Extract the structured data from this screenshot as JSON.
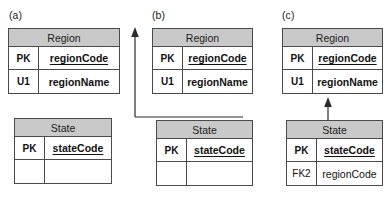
{
  "figure": {
    "panels": [
      {
        "label": "(a)",
        "tables": [
          {
            "name": "Region",
            "rows": [
              {
                "key": "PK",
                "attribute": "regionCode",
                "style": "pk"
              },
              {
                "key": "U1",
                "attribute": "regionName",
                "style": "bold"
              }
            ]
          },
          {
            "name": "State",
            "rows": [
              {
                "key": "PK",
                "attribute": "stateCode",
                "style": "pk"
              },
              {
                "key": "",
                "attribute": "",
                "style": "empty"
              }
            ]
          }
        ],
        "connector": "none"
      },
      {
        "label": "(b)",
        "tables": [
          {
            "name": "Region",
            "rows": [
              {
                "key": "PK",
                "attribute": "regionCode",
                "style": "pk"
              },
              {
                "key": "U1",
                "attribute": "regionName",
                "style": "bold"
              }
            ]
          },
          {
            "name": "State",
            "rows": [
              {
                "key": "PK",
                "attribute": "stateCode",
                "style": "pk"
              },
              {
                "key": "",
                "attribute": "",
                "style": "empty"
              }
            ]
          }
        ],
        "connector": "elbow-arrow-up-to-region"
      },
      {
        "label": "(c)",
        "tables": [
          {
            "name": "Region",
            "rows": [
              {
                "key": "PK",
                "attribute": "regionCode",
                "style": "pk"
              },
              {
                "key": "U1",
                "attribute": "regionName",
                "style": "bold"
              }
            ]
          },
          {
            "name": "State",
            "rows": [
              {
                "key": "PK",
                "attribute": "stateCode",
                "style": "pk"
              },
              {
                "key": "FK2",
                "attribute": "regionCode",
                "style": "normal"
              }
            ]
          }
        ],
        "connector": "straight-arrow-up-to-region"
      }
    ]
  },
  "colors": {
    "header_fill": "#c9c9c9",
    "border": "#4a4a4a",
    "text": "#111111",
    "connector": "#2a2a2a",
    "background": "#ffffff"
  }
}
